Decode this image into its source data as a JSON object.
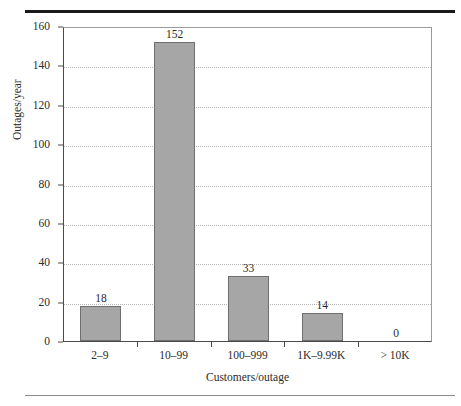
{
  "figure": {
    "background_color": "#ffffff",
    "bar_fill_color": "#a6a6a6",
    "bar_border_color": "#6f6f6f",
    "axis_color": "#4a4a4a",
    "grid_color": "#b4b4b4",
    "rule_top_color": "#1a1a1a",
    "rule_bottom_color": "#8a8a8a"
  },
  "chart_data": {
    "type": "bar",
    "title": "",
    "subtitle": "",
    "xlabel": "Customers/outage",
    "ylabel": "Outages/year",
    "categories": [
      "2–9",
      "10–99",
      "100–999",
      "1K–9.99K",
      "> 10K"
    ],
    "values": [
      18,
      152,
      33,
      14,
      0
    ],
    "data_labels": [
      "18",
      "152",
      "33",
      "14",
      "0"
    ],
    "ylim": [
      0,
      160
    ],
    "yticks": [
      0,
      20,
      40,
      60,
      80,
      100,
      120,
      140,
      160
    ],
    "ytick_labels": [
      "0",
      "20",
      "40",
      "60",
      "80",
      "100",
      "120",
      "140",
      "160"
    ],
    "grid": "horizontal-dotted",
    "legend": "none",
    "series": [
      {
        "name": "Outages/year",
        "values": [
          18,
          152,
          33,
          14,
          0
        ]
      }
    ]
  }
}
